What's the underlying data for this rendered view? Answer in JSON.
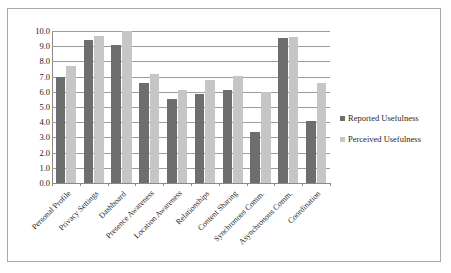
{
  "chart_data": {
    "type": "bar",
    "title": "",
    "subtitle": "",
    "xlabel": "",
    "ylabel": "",
    "ylim": [
      0,
      10
    ],
    "ytick_step": 1,
    "ytick_labels": [
      "0.0",
      "1.0",
      "2.0",
      "3.0",
      "4.0",
      "5.0",
      "6.0",
      "7.0",
      "8.0",
      "9.0",
      "10.0"
    ],
    "grid": true,
    "legend_position": "right",
    "categories": [
      "Personal Profile",
      "Privacy Settings",
      "Dashboard",
      "Presence Awareness",
      "Location Awareness",
      "Relationships",
      "Content Sharing",
      "Synchronous Comm.",
      "Asynchronous Comm.",
      "Coordination"
    ],
    "series": [
      {
        "name": "Reported Usefulness",
        "color": "#6e6e6e",
        "values": [
          6.95,
          9.4,
          9.1,
          6.6,
          5.55,
          5.85,
          6.15,
          3.35,
          9.55,
          4.1
        ]
      },
      {
        "name": "Perceived Usefulness",
        "color": "#c6c6c6",
        "values": [
          7.7,
          9.65,
          10.0,
          7.2,
          6.15,
          6.8,
          7.05,
          6.0,
          9.6,
          6.6
        ]
      }
    ]
  },
  "legend": {
    "items": [
      {
        "label": "Reported Usefulness",
        "marker": "square-marker-dark"
      },
      {
        "label": "Perceived Usefulness",
        "marker": "square-marker-light"
      }
    ]
  },
  "colors": {
    "reported": "#6e6e6e",
    "perceived": "#c6c6c6",
    "gridline": "#9d9d9d",
    "axis": "#8a8a8a",
    "frame_border": "#a8a8a8",
    "background": "#ffffff",
    "text": "#222222"
  }
}
